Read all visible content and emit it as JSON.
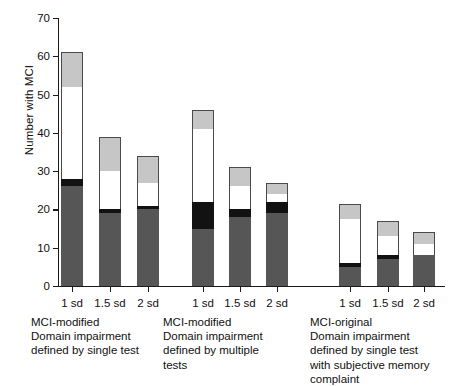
{
  "chart_data": {
    "type": "bar",
    "title": "",
    "subtitle": "",
    "xlabel": "",
    "ylabel": "Number with MCI",
    "ylim": [
      0,
      70
    ],
    "yticks": [
      0,
      10,
      20,
      30,
      40,
      50,
      60,
      70
    ],
    "ytick_labels": [
      "0",
      "10",
      "20",
      "30",
      "40",
      "50",
      "60",
      "70"
    ],
    "grid": false,
    "legend_position": "none",
    "stacked": true,
    "categories": [
      "1 sd",
      "1.5 sd",
      "2 sd",
      "1 sd",
      "1.5 sd",
      "2 sd",
      "1 sd",
      "1.5 sd",
      "2 sd"
    ],
    "series": [
      {
        "name": "dark-gray-segment",
        "color": "#565656",
        "values": [
          26,
          19,
          20,
          15,
          18,
          19,
          5,
          7,
          8
        ]
      },
      {
        "name": "black-segment",
        "color": "#121212",
        "values": [
          2,
          1,
          1,
          7,
          2,
          3,
          1,
          1,
          0
        ]
      },
      {
        "name": "white-segment",
        "color": "#ffffff",
        "values": [
          24,
          10,
          6,
          19,
          6,
          2,
          11.5,
          5,
          3
        ]
      },
      {
        "name": "light-gray-segment",
        "color": "#c6c6c6",
        "values": [
          9,
          9,
          7,
          5,
          5,
          3,
          4,
          4,
          3
        ]
      }
    ],
    "totals": [
      61,
      39,
      34,
      46,
      31,
      27,
      21.5,
      17,
      14
    ],
    "groups": [
      {
        "id": "mci-modified-single",
        "caption": "MCI-modified\nDomain impairment\ndefined by single test",
        "bars": [
          {
            "label": "1 sd",
            "total": 61,
            "segments": [
              26,
              2,
              24,
              9
            ]
          },
          {
            "label": "1.5 sd",
            "total": 39,
            "segments": [
              19,
              1,
              10,
              9
            ]
          },
          {
            "label": "2 sd",
            "total": 34,
            "segments": [
              20,
              1,
              6,
              7
            ]
          }
        ]
      },
      {
        "id": "mci-modified-multiple",
        "caption": "MCI-modified\nDomain impairment\ndefined by multiple\ntests",
        "bars": [
          {
            "label": "1 sd",
            "total": 46,
            "segments": [
              15,
              7,
              19,
              5
            ]
          },
          {
            "label": "1.5 sd",
            "total": 31,
            "segments": [
              18,
              2,
              6,
              5
            ]
          },
          {
            "label": "2 sd",
            "total": 27,
            "segments": [
              19,
              3,
              2,
              3
            ]
          }
        ]
      },
      {
        "id": "mci-original",
        "caption": "MCI-original\nDomain impairment\ndefined by single test\nwith subjective memory\ncomplaint",
        "bars": [
          {
            "label": "1 sd",
            "total": 21.5,
            "segments": [
              5,
              1,
              11.5,
              4
            ]
          },
          {
            "label": "1.5 sd",
            "total": 17,
            "segments": [
              7,
              1,
              5,
              4
            ]
          },
          {
            "label": "2 sd",
            "total": 14,
            "segments": [
              8,
              0,
              3,
              3
            ]
          }
        ]
      }
    ]
  },
  "axis": {
    "y_title": "Number with MCI"
  }
}
